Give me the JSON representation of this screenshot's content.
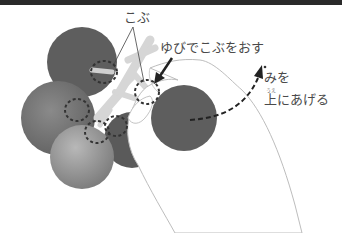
{
  "illustration": {
    "subject": "tomato-harvest-instructions",
    "colors": {
      "topbar": "#2a2a2a",
      "tomato_dark": "#5e5e5e",
      "tomato_mid": "#777777",
      "tomato_light": "#a0a0a0",
      "stem": "#d4d4d4",
      "hand_fill": "#ffffff",
      "hand_outline": "#bdbdbd",
      "dash": "#333333",
      "text": "#4a4a4a"
    },
    "labels": {
      "kobu": "こぶ",
      "push_instruction": "ゆびでこぶをおす",
      "lift_line1": "みを",
      "lift_ruby": "うえ",
      "lift_line2": "上にあげる"
    }
  }
}
